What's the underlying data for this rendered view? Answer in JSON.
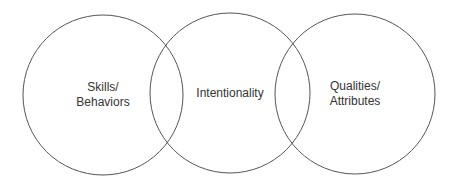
{
  "diagram": {
    "type": "venn",
    "stroke_color": "#555555",
    "text_color": "#333333",
    "circles": [
      {
        "id": "left",
        "cx": 103,
        "cy": 95,
        "r": 80,
        "label_lines": [
          "Skills/",
          "Behaviors"
        ]
      },
      {
        "id": "middle",
        "cx": 230,
        "cy": 93,
        "r": 80,
        "label_lines": [
          "Intentionality"
        ]
      },
      {
        "id": "right",
        "cx": 355,
        "cy": 94,
        "r": 80,
        "label_lines": [
          "Qualities/",
          "Attributes"
        ]
      }
    ]
  }
}
